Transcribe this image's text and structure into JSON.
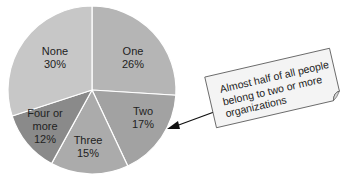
{
  "chart_data": {
    "type": "pie",
    "title": "",
    "categories": [
      "One",
      "Two",
      "Three",
      "Four or more",
      "None"
    ],
    "values": [
      26,
      17,
      15,
      12,
      30
    ],
    "unit": "%",
    "start_angle": "12 o'clock",
    "direction": "clockwise",
    "slices": [
      {
        "label": "One",
        "value": 26,
        "display": "26%",
        "color": "#b5b5b5"
      },
      {
        "label": "Two",
        "value": 17,
        "display": "17%",
        "color": "#a2a2a2"
      },
      {
        "label": "Three",
        "value": 15,
        "display": "15%",
        "color": "#ababab"
      },
      {
        "label": "Four or more",
        "value": 12,
        "display": "12%",
        "color": "#8a8a8a"
      },
      {
        "label": "None",
        "value": 30,
        "display": "30%",
        "color": "#c7c7c7"
      }
    ],
    "annotations": [
      {
        "text": "Almost half of all people belong to two or more organizations",
        "points_to": "Two"
      }
    ],
    "legend": "none (labels inside slices)"
  },
  "labels": {
    "one": "One\n26%",
    "two": "Two\n17%",
    "three": "Three\n15%",
    "four": "Four or\nmore\n12%",
    "none": "None\n30%"
  },
  "callout": {
    "text": "Almost half of all people belong to two or more organizations"
  }
}
